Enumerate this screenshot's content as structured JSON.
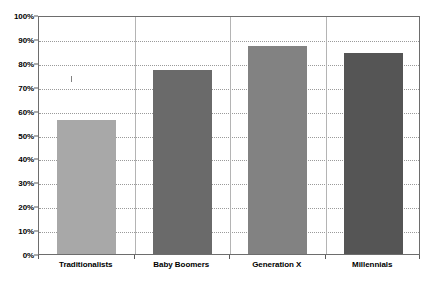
{
  "chart_data": {
    "type": "bar",
    "title": "",
    "title_note": "chart title is cut off at the top edge of the screenshot",
    "xlabel": "",
    "ylabel": "",
    "categories": [
      "Traditionalists",
      "Baby Boomers",
      "Generation X",
      "Millennials"
    ],
    "values": [
      56,
      77,
      87,
      84
    ],
    "value_labels": [
      "56%",
      "77%",
      "87%",
      "84%"
    ],
    "ylim": [
      0,
      100
    ],
    "ytick_labels": [
      "0%",
      "10%",
      "20%",
      "30%",
      "40%",
      "50%",
      "60%",
      "70%",
      "80%",
      "90%",
      "100%"
    ],
    "ytick_values": [
      0,
      10,
      20,
      30,
      40,
      50,
      60,
      70,
      80,
      90,
      100
    ],
    "grid": "horizontal-dotted-plus-vertical-category-dividers",
    "legend": "none",
    "legend_position": "none",
    "series": [
      {
        "name": "Percent",
        "values": [
          56,
          77,
          87,
          84
        ],
        "colors": [
          "#a8a8a8",
          "#6a6a6a",
          "#828282",
          "#555555"
        ]
      }
    ]
  },
  "style": {
    "plot_border_color": "#6d6d6d",
    "gridline_color": "#9a9a9a",
    "divider_color": "#b4b4b4",
    "tick_color": "#5a5a5a",
    "label_color": "#000000",
    "background": "#ffffff"
  }
}
